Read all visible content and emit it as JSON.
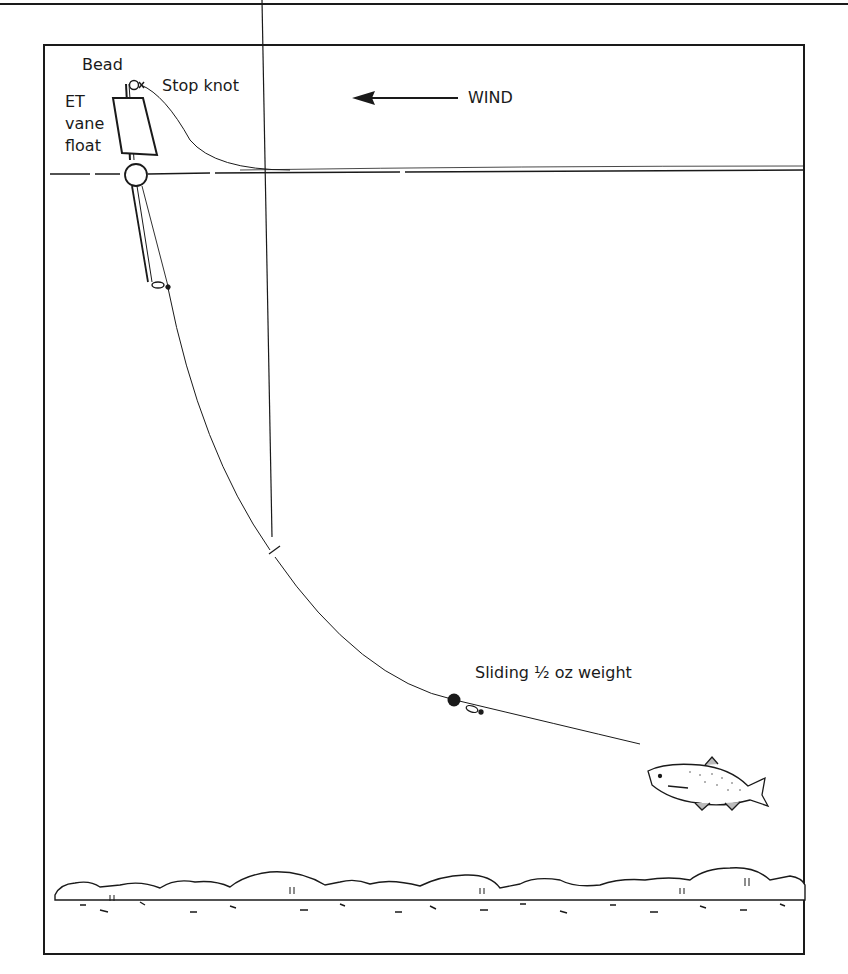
{
  "diagram": {
    "type": "fishing-rig-illustration",
    "labels": {
      "bead": "Bead",
      "stop_knot": "Stop knot",
      "float_line1": "ET",
      "float_line2": "vane",
      "float_line3": "float",
      "wind": "WIND",
      "weight": "Sliding ½ oz weight"
    },
    "elements": [
      "bead",
      "stop-knot",
      "et-vane-float",
      "water-surface",
      "main-line",
      "line-break-mark",
      "sliding-weight",
      "swivel",
      "bait-fish",
      "lake-bed-stones",
      "wind-arrow"
    ],
    "colors": {
      "ink": "#1a1a1a",
      "background": "#ffffff"
    }
  }
}
